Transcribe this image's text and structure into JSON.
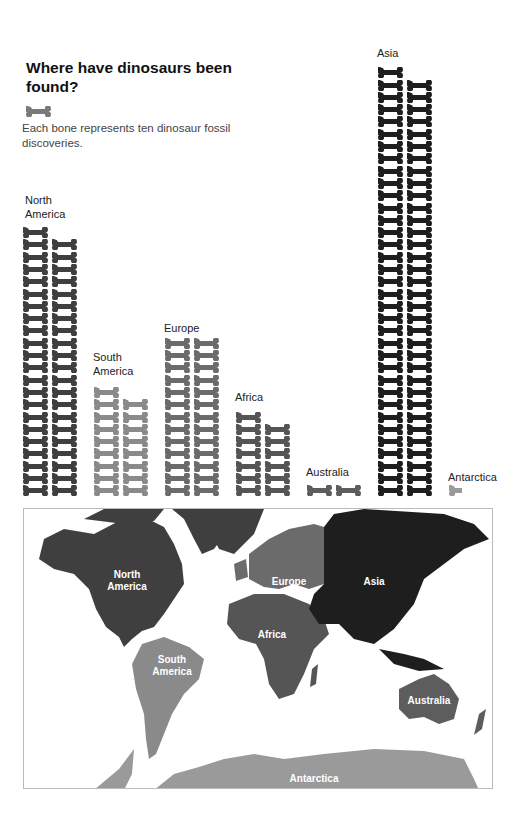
{
  "title": "Where have dinosaurs been found?",
  "legend": {
    "icon": "bone-icon",
    "text": "Each bone represents ten dinosaur fossil discoveries."
  },
  "colors": {
    "north_america": "#3f3f3f",
    "south_america": "#8a8a8a",
    "europe": "#6b6b6b",
    "africa": "#555555",
    "australia": "#5d5d5d",
    "asia": "#1e1e1e",
    "antarctica": "#9a9a9a",
    "legend": "#7a7a7a"
  },
  "continents": [
    {
      "key": "north_america",
      "label": "North America",
      "label_lines": [
        "North",
        "America"
      ],
      "bones": 43,
      "map_label": "North America"
    },
    {
      "key": "south_america",
      "label": "South America",
      "label_lines": [
        "South",
        "America"
      ],
      "bones": 17,
      "map_label": "South America"
    },
    {
      "key": "europe",
      "label": "Europe",
      "label_lines": [
        "Europe"
      ],
      "bones": 26,
      "map_label": "Europe"
    },
    {
      "key": "africa",
      "label": "Africa",
      "label_lines": [
        "Africa"
      ],
      "bones": 13,
      "map_label": "Africa"
    },
    {
      "key": "australia",
      "label": "Australia",
      "label_lines": [
        "Australia"
      ],
      "bones": 2,
      "map_label": "Australia"
    },
    {
      "key": "asia",
      "label": "Asia",
      "label_lines": [
        "Asia"
      ],
      "bones": 69,
      "map_label": "Asia"
    },
    {
      "key": "antarctica",
      "label": "Antarctica",
      "label_lines": [
        "Antarctica"
      ],
      "bones": 0.5,
      "map_label": "Antarctica"
    }
  ],
  "chart_data": {
    "type": "bar",
    "subtype": "pictograph",
    "title": "Where have dinosaurs been found?",
    "unit_note": "Each bone represents ten dinosaur fossil discoveries.",
    "categories": [
      "North America",
      "South America",
      "Europe",
      "Africa",
      "Australia",
      "Asia",
      "Antarctica"
    ],
    "values_bones": [
      43,
      17,
      26,
      13,
      2,
      69,
      0.5
    ],
    "values": [
      430,
      170,
      260,
      130,
      20,
      690,
      5
    ],
    "xlabel": "",
    "ylabel": "Dinosaur fossil discoveries",
    "grid": false,
    "legend_position": "top-left"
  }
}
